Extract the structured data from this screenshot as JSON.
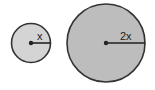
{
  "diagram": {
    "small_circle": {
      "radius_label": "x",
      "fill": "#d4d4d4",
      "stroke": "#333333"
    },
    "large_circle": {
      "radius_label": "2x",
      "fill": "#bdbdbd",
      "stroke": "#333333"
    }
  }
}
